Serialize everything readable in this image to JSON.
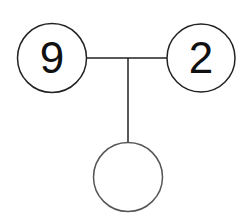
{
  "diagram": {
    "type": "number-bond",
    "parts": [
      {
        "id": "left",
        "value": "9"
      },
      {
        "id": "right",
        "value": "2"
      }
    ],
    "whole": {
      "id": "bottom",
      "value": ""
    },
    "colors": {
      "stroke": "#222222",
      "text": "#111111",
      "background": "#ffffff"
    }
  }
}
